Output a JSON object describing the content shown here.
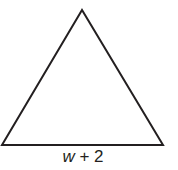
{
  "figure": {
    "shape": "triangle",
    "stroke_color": "#231f20",
    "fill_color": "#ffffff",
    "vertices": {
      "apex": [
        82,
        10
      ],
      "bottom_left": [
        2,
        145
      ],
      "bottom_right": [
        163,
        145
      ]
    },
    "base_label": {
      "variable": "w",
      "rest": " + 2",
      "full": "w + 2"
    }
  }
}
